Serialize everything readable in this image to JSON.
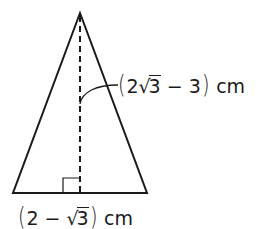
{
  "diagram": {
    "type": "isosceles-triangle",
    "shape": {
      "apex": [
        80,
        13
      ],
      "base_left": [
        13,
        193
      ],
      "base_right": [
        147,
        193
      ],
      "altitude_foot": [
        80,
        193
      ],
      "stroke_color": "#1a1a1a",
      "fill_color": "#ffffff"
    },
    "height_label": {
      "open": "(",
      "coef": "2",
      "radicand": "3",
      "rest": " − 3",
      "close": ")",
      "unit": "cm",
      "full_text": "(2√3 − 3) cm"
    },
    "base_label": {
      "open": "(",
      "lead": "2 − ",
      "radicand": "3",
      "close": ")",
      "unit": "cm",
      "full_text": "(2 − √3) cm"
    },
    "marks": {
      "right_angle": "right-angle-marker",
      "altitude": "dashed-altitude"
    }
  }
}
